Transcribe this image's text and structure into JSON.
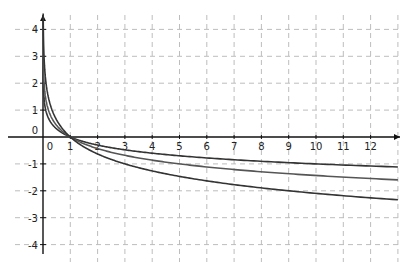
{
  "chart_data": {
    "type": "line",
    "title": "",
    "xlabel": "",
    "ylabel": "",
    "xlim": [
      -1,
      13
    ],
    "ylim": [
      -4.5,
      4.5
    ],
    "grid": true,
    "grid_style": "dashed",
    "legend": null,
    "x_ticks": [
      "0",
      "1",
      "2",
      "3",
      "4",
      "5",
      "6",
      "7",
      "8",
      "9",
      "10",
      "11",
      "12"
    ],
    "y_ticks": [
      "4",
      "3",
      "2",
      "1",
      "0",
      "-1",
      "-2",
      "-3",
      "-4"
    ],
    "series": [
      {
        "name": "y = log_(1/10)(x)",
        "base": 0.1,
        "color": "#333333",
        "x": [
          0.05,
          0.5,
          1,
          2,
          4,
          8,
          13
        ],
        "values": [
          1.3,
          0.3,
          0,
          -0.3,
          -0.6,
          -0.9,
          -1.11
        ]
      },
      {
        "name": "y = log_(1/5)(x)",
        "base": 0.2,
        "color": "#555555",
        "x": [
          0.05,
          0.5,
          1,
          2,
          4,
          8,
          13
        ],
        "values": [
          1.86,
          0.43,
          0,
          -0.43,
          -0.86,
          -1.29,
          -1.59
        ]
      },
      {
        "name": "y = log_(1/3)(x)",
        "base": 0.3333,
        "color": "#333333",
        "x": [
          0.05,
          0.5,
          1,
          2,
          4,
          8,
          13
        ],
        "values": [
          2.73,
          0.63,
          0,
          -0.63,
          -1.26,
          -1.89,
          -2.33
        ]
      }
    ]
  }
}
